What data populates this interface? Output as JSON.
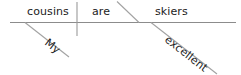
{
  "diagram": {
    "type": "reed-kellogg-sentence-diagram",
    "sentence": "My cousins are excellent skiers.",
    "colors": {
      "background": "#ffffff",
      "text": "#1b1b1b",
      "baseline": "#8c8c8c",
      "divider": "#9a9a9a",
      "slant": "#a2a2a2"
    },
    "baseline": {
      "label": "baseline",
      "x1": 10,
      "y1": 22.5,
      "x2": 236,
      "y2": 22.5
    },
    "subject_verb_divider": {
      "label": "subject-verb divider",
      "x1": 77,
      "y1": 2,
      "x2": 77,
      "y2": 36
    },
    "complement_slant": {
      "label": "predicate-complement slant",
      "x1": 117,
      "y1": 1.5,
      "x2": 139,
      "y2": 22.5
    },
    "words": [
      {
        "id": "subject",
        "text": "cousins",
        "role": "subject noun",
        "x": 27,
        "y": 15,
        "rotate": 0
      },
      {
        "id": "verb",
        "text": "are",
        "role": "linking verb",
        "x": 92,
        "y": 15,
        "rotate": 0
      },
      {
        "id": "predicate-nominative",
        "text": "skiers",
        "role": "predicate nominative",
        "x": 155,
        "y": 15,
        "rotate": 0
      },
      {
        "id": "subject-modifier",
        "text": "My",
        "role": "possessive adjective modifying subject",
        "x": 44,
        "y": 44,
        "rotate": 38
      },
      {
        "id": "complement-modifier",
        "text": "excellent",
        "role": "adjective modifying predicate nominative",
        "x": 164,
        "y": 41,
        "rotate": 38
      }
    ],
    "modifier_lines": [
      {
        "id": "subject-modifier-line",
        "label": "modifier line for My",
        "x1": 25,
        "y1": 22.5,
        "x2": 69,
        "y2": 57
      },
      {
        "id": "complement-modifier-line",
        "label": "modifier line for excellent",
        "x1": 151,
        "y1": 22.5,
        "x2": 217,
        "y2": 74
      }
    ]
  }
}
